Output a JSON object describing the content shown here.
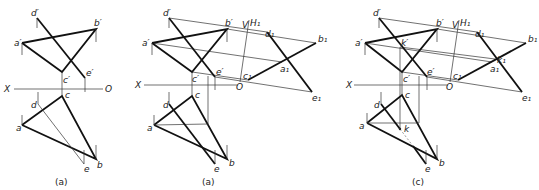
{
  "panels": [
    {
      "caption": "(a)",
      "labels": {
        "d_prime": "d′",
        "b_prime": "b′",
        "a_prime": "a′",
        "c_prime": "c′",
        "e_prime": "e′",
        "X": "X",
        "O": "O",
        "c": "c",
        "d": "d",
        "a": "a",
        "e": "e",
        "b": "b"
      }
    },
    {
      "caption": "(a)",
      "labels": {
        "d_prime": "d′",
        "b_prime": "b′",
        "a_prime": "a′",
        "c_prime": "c′",
        "e_prime": "e′",
        "X": "X",
        "O": "O",
        "c": "c",
        "d": "d",
        "a": "a",
        "e": "e",
        "b": "b",
        "V": "V",
        "H1": "H₁",
        "d1": "d₁",
        "b1": "b₁",
        "a1": "a₁",
        "c1": "c₁",
        "e1": "e₁"
      }
    },
    {
      "caption": "(c)",
      "labels": {
        "d_prime": "d′",
        "b_prime": "b′",
        "a_prime": "a′",
        "k_prime": "k′",
        "c_prime": "c′",
        "e_prime": "e′",
        "X": "X",
        "O": "O",
        "c": "c",
        "d": "d",
        "a": "a",
        "k": "k",
        "e": "e",
        "b": "b",
        "V": "V",
        "H1": "H₁",
        "d1": "d₁",
        "b1": "b₁",
        "a1": "a₁",
        "k1": "k₁",
        "c1": "c₁",
        "e1": "e₁"
      }
    }
  ]
}
